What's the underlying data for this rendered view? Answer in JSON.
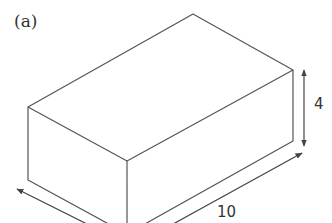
{
  "figure": {
    "panel_label": "(a)",
    "shape": "rectangular cuboid",
    "dimensions": {
      "height_label": "4",
      "length_label": "10"
    },
    "colors": {
      "stroke": "#555555",
      "text": "#333333",
      "background": "#ffffff"
    }
  }
}
